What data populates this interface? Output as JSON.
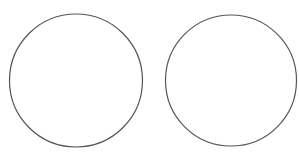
{
  "canvas": {
    "width": 299,
    "height": 161,
    "background": "#ffffff"
  },
  "shapes": [
    {
      "type": "circle",
      "name": "left-circle",
      "cx": 76,
      "cy": 80.5,
      "r": 66.5,
      "stroke": "#555555",
      "fill": "none"
    },
    {
      "type": "circle",
      "name": "right-circle",
      "cx": 231,
      "cy": 80.5,
      "r": 65.5,
      "stroke": "#555555",
      "fill": "none"
    }
  ]
}
